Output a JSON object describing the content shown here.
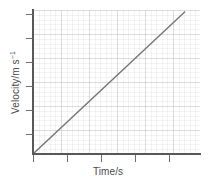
{
  "figure": {
    "background_color": "#ffffff",
    "axis_color": "#58585a",
    "tick_color": "#6d6d70",
    "line_color": "#767678",
    "grid_color": "#e9e9ee",
    "label_color": "#4a4a4c"
  },
  "chart_data": {
    "type": "line",
    "title": "",
    "xlabel": "Time/s",
    "ylabel": "Velocity/m s⁻¹",
    "ylabel_text": "Velocity/m s",
    "ylabel_superscript": "−1",
    "grid": true,
    "grid_minor": true,
    "legend": false,
    "xlim": [
      0,
      6
    ],
    "ylim": [
      0,
      6
    ],
    "xticks": [
      0,
      1,
      2,
      3,
      4,
      5,
      6
    ],
    "yticks": [
      0,
      1,
      2,
      3,
      4,
      5,
      6
    ],
    "xticklabels": [
      "",
      "",
      "",
      "",
      "",
      "",
      ""
    ],
    "yticklabels": [
      "",
      "",
      "",
      "",
      "",
      "",
      ""
    ],
    "series": [
      {
        "name": "velocity",
        "x": [
          0.0,
          5.45
        ],
        "y": [
          0.0,
          5.92
        ],
        "color": "#767678",
        "linewidth": 1.4,
        "description": "straight line through origin — constant acceleration"
      }
    ]
  },
  "ticks": {
    "x_positions_px": [
      33,
      67,
      101,
      135,
      169
    ],
    "y_positions_px": [
      14,
      38,
      62,
      86,
      110,
      134
    ]
  }
}
